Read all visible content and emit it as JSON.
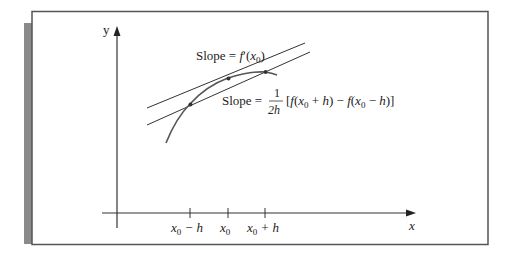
{
  "figure": {
    "y_axis_label": "y",
    "x_axis_label": "x",
    "tangent_label": {
      "prefix": "Slope = ",
      "f": "f",
      "prime": "′",
      "open": "(",
      "x": "x",
      "sub": "0",
      "close": ")"
    },
    "secant_label": {
      "prefix": "Slope = ",
      "frac_num": "1",
      "frac_den": "2h",
      "expr_part1": "[",
      "f1": "f",
      "p1": "(",
      "x1": "x",
      "sub1": "0",
      "plus": " + ",
      "h1": "h",
      "c1": ")",
      "minus": " − ",
      "f2": "f",
      "p2": "(",
      "x2": "x",
      "sub2": "0",
      "minus2": " − ",
      "h2": "h",
      "c2": ")]"
    },
    "ticks": [
      {
        "base": "x",
        "sub": "0",
        "suffix": " − h"
      },
      {
        "base": "x",
        "sub": "0",
        "suffix": ""
      },
      {
        "base": "x",
        "sub": "0",
        "suffix": " + h"
      }
    ],
    "colors": {
      "frame": "#555555",
      "shadow": "#8a8a8a",
      "line": "#333333",
      "curve": "#555555"
    }
  }
}
